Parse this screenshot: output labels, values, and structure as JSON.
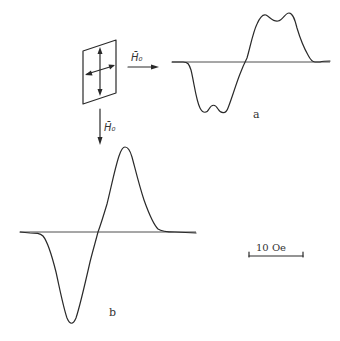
{
  "figure": {
    "sample_icon": "thin-film-sample-with-easy-axes",
    "field_label_horizontal": "H̄₀",
    "field_label_vertical": "H̄₀",
    "curve_a_label": "a",
    "curve_b_label": "b",
    "scale_bar_label": "10 Oe"
  },
  "colors": {
    "ink": "#2a2a2a",
    "background": "#ffffff"
  }
}
